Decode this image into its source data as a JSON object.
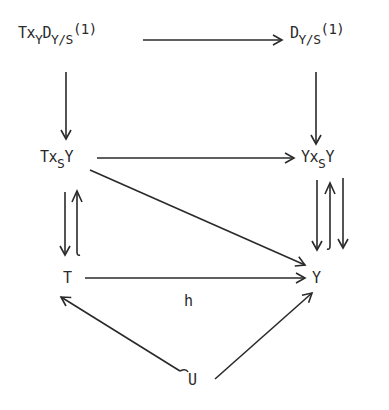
{
  "diagram": {
    "type": "commutative-diagram",
    "nodes": {
      "top_left": {
        "parts": [
          "Tx",
          "Y",
          "D",
          "Y/S",
          "(1)"
        ],
        "text": "Tx_Y D_Y/S(1)"
      },
      "top_right": {
        "parts": [
          "D",
          "Y/S",
          "(1)"
        ],
        "text": "D_Y/S(1)"
      },
      "mid_left": {
        "parts": [
          "Tx",
          "S",
          "Y"
        ],
        "text": "Tx_S Y"
      },
      "mid_right": {
        "parts": [
          "Yx",
          "S",
          "Y"
        ],
        "text": "Yx_S Y"
      },
      "bottom_left": {
        "text": "T"
      },
      "bottom_right": {
        "text": "Y"
      },
      "bottom_center": {
        "text": "U"
      }
    },
    "edge_labels": {
      "T_to_Y": "h"
    },
    "edges": [
      {
        "from": "Tx_Y D_Y/S(1)",
        "to": "D_Y/S(1)",
        "style": "arrow"
      },
      {
        "from": "Tx_Y D_Y/S(1)",
        "to": "Tx_S Y",
        "style": "arrow"
      },
      {
        "from": "D_Y/S(1)",
        "to": "Yx_S Y",
        "style": "arrow"
      },
      {
        "from": "Tx_S Y",
        "to": "Yx_S Y",
        "style": "arrow"
      },
      {
        "from": "Tx_S Y",
        "to": "Y",
        "style": "arrow"
      },
      {
        "from": "Tx_S Y",
        "to": "T",
        "style": "arrow"
      },
      {
        "from": "T",
        "to": "Tx_S Y",
        "style": "hook-arrow"
      },
      {
        "from": "Yx_S Y",
        "to": "Y",
        "style": "arrow",
        "note": "first projection"
      },
      {
        "from": "Y",
        "to": "Yx_S Y",
        "style": "hook-arrow",
        "note": "diagonal"
      },
      {
        "from": "Yx_S Y",
        "to": "Y",
        "style": "arrow",
        "note": "second projection"
      },
      {
        "from": "T",
        "to": "Y",
        "style": "arrow",
        "label": "h"
      },
      {
        "from": "U",
        "to": "T",
        "style": "hook-arrow"
      },
      {
        "from": "U",
        "to": "Y",
        "style": "arrow"
      }
    ],
    "colors": {
      "ink": "#2a2a2a",
      "background": "#ffffff"
    }
  }
}
